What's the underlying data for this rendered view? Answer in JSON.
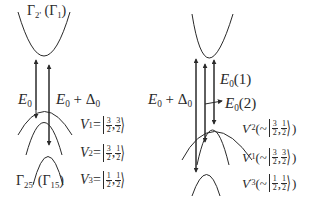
{
  "left_panel": {
    "conduction_band_label": {
      "main": "Γ",
      "sub": "2'",
      "alt_main": "Γ",
      "alt_sub": "1"
    },
    "transition_labels": {
      "e0": {
        "main": "E",
        "sub": "0"
      },
      "e0_plus_delta": {
        "main": "E",
        "sub": "0",
        "plus": " + Δ",
        "delta_sub": "0"
      }
    },
    "valence_band_label": {
      "main": "Γ",
      "sub": "25'",
      "alt_main": "Γ",
      "alt_sub": "15"
    },
    "valence_states": [
      {
        "name": "V",
        "sub": "1",
        "eq": " = ",
        "j_num": "3",
        "j_den": "2",
        "mj_num": "3",
        "mj_den": "2"
      },
      {
        "name": "V",
        "sub": "2",
        "eq": " = ",
        "j_num": "3",
        "j_den": "2",
        "mj_num": "1",
        "mj_den": "2"
      },
      {
        "name": "V",
        "sub": "3",
        "eq": " = ",
        "j_num": "1",
        "j_den": "2",
        "mj_num": "1",
        "mj_den": "2"
      }
    ]
  },
  "right_panel": {
    "transition_labels": {
      "e0_plus_delta": {
        "main": "E",
        "sub": "0",
        "plus": " + Δ",
        "delta_sub": "0"
      },
      "e0_1": {
        "main": "E",
        "sub": "0",
        "arg": "(1)"
      },
      "e0_2": {
        "main": "E",
        "sub": "0",
        "arg": "(2)"
      }
    },
    "valence_states": [
      {
        "name": "V",
        "sub": "2",
        "prime": "'",
        "approx": "~",
        "j_num": "3",
        "j_den": "2",
        "mj_num": "1",
        "mj_den": "2"
      },
      {
        "name": "V",
        "sub": "1",
        "prime": "'",
        "approx": "~",
        "j_num": "3",
        "j_den": "2",
        "mj_num": "3",
        "mj_den": "2"
      },
      {
        "name": "V",
        "sub": "3",
        "prime": "'",
        "approx": "~",
        "j_num": "1",
        "j_den": "2",
        "mj_num": "1",
        "mj_den": "2"
      }
    ]
  },
  "colors": {
    "line": "#2a2a2a",
    "background": "#ffffff"
  }
}
